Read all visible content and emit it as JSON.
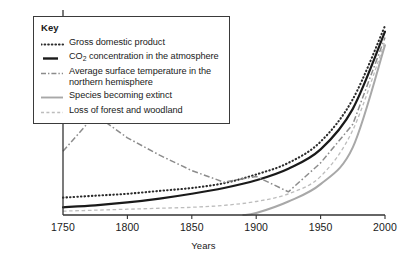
{
  "legend": {
    "title": "Key",
    "entries": [
      {
        "label": "Gross domestic product",
        "style": "dotted",
        "color": "#2b2b2b",
        "series_key": "gdp"
      },
      {
        "label": "CO2 concentration in the atmosphere",
        "label_pre": "CO",
        "label_sub": "2",
        "label_post": " concentration in the atmosphere",
        "style": "solid-thick",
        "color": "#1a1a1a",
        "series_key": "co2"
      },
      {
        "label": "Average surface temperature in the northern hemisphere",
        "style": "dash-dot",
        "color": "#8c8c8c",
        "series_key": "temperature"
      },
      {
        "label": "Species becoming extinct",
        "style": "solid",
        "color": "#a8a8a8",
        "series_key": "species"
      },
      {
        "label": "Loss of forest and woodland",
        "style": "dashed",
        "color": "#bdbdbd",
        "series_key": "forest"
      }
    ]
  },
  "axis": {
    "x_title": "Years",
    "x_ticks": [
      "1750",
      "1800",
      "1850",
      "1900",
      "1950",
      "2000"
    ],
    "x_min": 1750,
    "x_max": 2000
  },
  "chart_data": {
    "type": "line",
    "title": "",
    "xlabel": "Years",
    "ylabel": "",
    "xlim": [
      1750,
      2000
    ],
    "ylim": [
      0,
      100
    ],
    "grid": false,
    "legend_position": "top-left",
    "axis_note": "Vertical axis unlabelled and unscaled; all series plotted on a common relative scale rising steeply after 1950.",
    "x": [
      1750,
      1775,
      1800,
      1825,
      1850,
      1875,
      1900,
      1925,
      1950,
      1975,
      2000
    ],
    "series": [
      {
        "name": "Gross domestic product",
        "key": "gdp",
        "style": "dotted",
        "color": "#2b2b2b",
        "values": [
          9,
          10,
          11,
          12.5,
          14,
          16.5,
          21,
          27,
          38,
          60,
          98
        ]
      },
      {
        "name": "CO2 concentration in the atmosphere",
        "key": "co2",
        "style": "solid-thick",
        "color": "#1a1a1a",
        "values": [
          4,
          5,
          6.5,
          8.5,
          11,
          14,
          18,
          24,
          34,
          55,
          95
        ]
      },
      {
        "name": "Average surface temperature in the northern hemisphere",
        "key": "temperature",
        "style": "dash-dot",
        "color": "#8c8c8c",
        "values": [
          33,
          52,
          40,
          31,
          23,
          17,
          20,
          12,
          27,
          47,
          92
        ]
      },
      {
        "name": "Species becoming extinct",
        "key": "species",
        "style": "solid",
        "color": "#a8a8a8",
        "start_year": 1890,
        "values": [
          null,
          null,
          null,
          null,
          null,
          null,
          1,
          7,
          16,
          35,
          88
        ]
      },
      {
        "name": "Loss of forest and woodland",
        "key": "forest",
        "style": "dashed",
        "color": "#bdbdbd",
        "values": [
          2,
          2.5,
          3,
          3.5,
          4,
          5,
          7,
          11,
          20,
          44,
          90
        ]
      }
    ]
  }
}
